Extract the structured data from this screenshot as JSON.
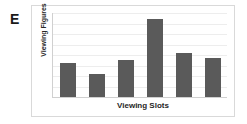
{
  "panel": {
    "letter": "E"
  },
  "chart_data": {
    "type": "bar",
    "title": "",
    "xlabel": "Viewing Slots",
    "ylabel": "Viewing Figures",
    "categories": [
      "1",
      "2",
      "3",
      "4",
      "5",
      "6"
    ],
    "values": [
      41,
      27,
      44,
      93,
      52,
      46
    ],
    "ylim": [
      0,
      100
    ],
    "grid": true,
    "gridline_count": 9,
    "legend": "none",
    "tick_labels_visible": false,
    "bar_color": "#5a5a5a",
    "gridline_color": "#ededed",
    "axis_color": "#d0d0d0",
    "frame_color": "#d9d9d9",
    "background": "#ffffff"
  }
}
